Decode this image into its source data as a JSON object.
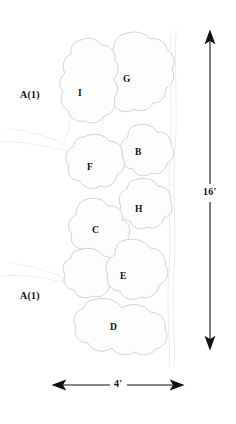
{
  "figure": {
    "type": "tree-canopy-plan-diagram",
    "background_color": "#ffffff",
    "canopy_outline_color": "#d2d2d2",
    "canopy_fill_color": "#fdfdfd",
    "faint_line_color": "#ededed",
    "dimension_color": "#111111",
    "label_color": "#111111"
  },
  "area_labels": [
    {
      "id": "area-top",
      "text": "A(1)",
      "x": 36,
      "y": 96
    },
    {
      "id": "area-bottom",
      "text": "A(1)",
      "x": 36,
      "y": 297
    }
  ],
  "canopies": [
    {
      "id": "I",
      "text": "I",
      "x": 80,
      "y": 94,
      "cx": 82,
      "cy": 95
    },
    {
      "id": "G",
      "text": "G",
      "x": 126,
      "y": 80,
      "cx": 128,
      "cy": 82
    },
    {
      "id": "B",
      "text": "B",
      "x": 138,
      "y": 153,
      "cx": 140,
      "cy": 155
    },
    {
      "id": "F",
      "text": "F",
      "x": 89,
      "y": 168,
      "cx": 91,
      "cy": 170
    },
    {
      "id": "H",
      "text": "H",
      "x": 138,
      "y": 210,
      "cx": 140,
      "cy": 212
    },
    {
      "id": "C",
      "text": "C",
      "x": 95,
      "y": 231,
      "cx": 97,
      "cy": 233
    },
    {
      "id": "E",
      "text": "E",
      "x": 122,
      "y": 277,
      "cx": 124,
      "cy": 279
    },
    {
      "id": "D",
      "text": "D",
      "x": 112,
      "y": 328,
      "cx": 114,
      "cy": 330
    }
  ],
  "dimensions": {
    "vertical": {
      "label": "16'",
      "x": 210,
      "y_top": 32,
      "y_bottom": 348,
      "label_y": 193
    },
    "horizontal": {
      "label": "4'",
      "y": 385,
      "x_left": 53,
      "x_right": 183,
      "label_x": 118
    }
  }
}
